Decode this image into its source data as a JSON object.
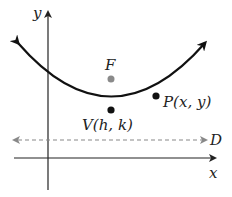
{
  "diagram": {
    "axes": {
      "x_label": "x",
      "y_label": "y"
    },
    "focus": {
      "label": "F",
      "color": "#8a8a8a"
    },
    "vertex": {
      "label": "V(h, k)"
    },
    "point": {
      "label": "P(x, y)"
    },
    "directrix": {
      "label": "D"
    },
    "colors": {
      "curve": "#111111",
      "axis": "#222222",
      "directrix": "#888888"
    }
  }
}
